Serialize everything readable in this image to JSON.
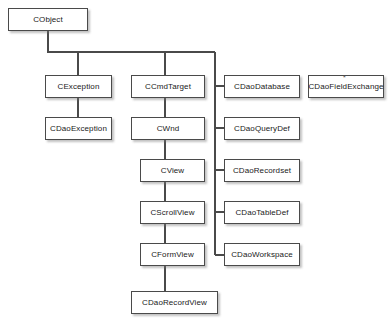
{
  "diagram": {
    "type": "class-hierarchy",
    "background_color": "#ffffff",
    "box_border_color": "#4a4a4a",
    "box_fill_color": "#ffffff",
    "edge_color": "#4a4a4a",
    "text_color": "#1a1a1a",
    "nodes": [
      {
        "id": "cobject",
        "label": "CObject",
        "x": 8,
        "y": 8,
        "w": 80,
        "h": 23
      },
      {
        "id": "cexception",
        "label": "CException",
        "x": 45,
        "y": 75,
        "w": 67,
        "h": 23
      },
      {
        "id": "cdaoexception",
        "label": "CDaoException",
        "x": 45,
        "y": 117,
        "w": 67,
        "h": 23
      },
      {
        "id": "ccmdtarget",
        "label": "CCmdTarget",
        "x": 131,
        "y": 75,
        "w": 74,
        "h": 23
      },
      {
        "id": "cwnd",
        "label": "CWnd",
        "x": 131,
        "y": 117,
        "w": 74,
        "h": 23
      },
      {
        "id": "cview",
        "label": "CView",
        "x": 140,
        "y": 159,
        "w": 65,
        "h": 23
      },
      {
        "id": "cscrollview",
        "label": "CScrollView",
        "x": 140,
        "y": 201,
        "w": 65,
        "h": 23
      },
      {
        "id": "cformview",
        "label": "CFormView",
        "x": 140,
        "y": 243,
        "w": 65,
        "h": 23
      },
      {
        "id": "cdaorecordview",
        "label": "CDaoRecordView",
        "x": 131,
        "y": 291,
        "w": 87,
        "h": 23
      },
      {
        "id": "cdaodatabase",
        "label": "CDaoDatabase",
        "x": 224,
        "y": 75,
        "w": 76,
        "h": 23
      },
      {
        "id": "cdaoquerydef",
        "label": "CDaoQueryDef",
        "x": 224,
        "y": 117,
        "w": 76,
        "h": 23
      },
      {
        "id": "cdaorecordset",
        "label": "CDaoRecordset",
        "x": 224,
        "y": 159,
        "w": 76,
        "h": 23
      },
      {
        "id": "cdaotabledef",
        "label": "CDaoTableDef",
        "x": 224,
        "y": 201,
        "w": 76,
        "h": 23
      },
      {
        "id": "cdaoworkspace",
        "label": "CDaoWorkspace",
        "x": 224,
        "y": 243,
        "w": 76,
        "h": 23
      },
      {
        "id": "cdaofieldexchange",
        "label": "CDaoFieldExchange",
        "x": 308,
        "y": 75,
        "w": 76,
        "h": 23
      }
    ],
    "edges": [
      {
        "from": "cobject",
        "to": "cexception",
        "style": "orthogonal"
      },
      {
        "from": "cobject",
        "to": "ccmdtarget",
        "style": "orthogonal"
      },
      {
        "from": "cobject",
        "to": "cdao-bus",
        "style": "orthogonal"
      },
      {
        "from": "cexception",
        "to": "cdaoexception",
        "style": "vertical"
      },
      {
        "from": "ccmdtarget",
        "to": "cwnd",
        "style": "vertical"
      },
      {
        "from": "cwnd",
        "to": "cview",
        "style": "vertical"
      },
      {
        "from": "cview",
        "to": "cscrollview",
        "style": "vertical"
      },
      {
        "from": "cscrollview",
        "to": "cformview",
        "style": "vertical"
      },
      {
        "from": "cformview",
        "to": "cdaorecordview",
        "style": "vertical"
      },
      {
        "from": "cdao-bus",
        "to": "cdaodatabase",
        "style": "elbow"
      },
      {
        "from": "cdao-bus",
        "to": "cdaoquerydef",
        "style": "elbow"
      },
      {
        "from": "cdao-bus",
        "to": "cdaorecordset",
        "style": "elbow"
      },
      {
        "from": "cdao-bus",
        "to": "cdaotabledef",
        "style": "elbow"
      },
      {
        "from": "cdao-bus",
        "to": "cdaoworkspace",
        "style": "elbow"
      }
    ],
    "detached_nodes": [
      "cdaofieldexchange"
    ],
    "marks": [
      {
        "id": "speck-above-cdaofieldexchange",
        "glyph": "*",
        "x": 343,
        "y": 74
      }
    ]
  }
}
